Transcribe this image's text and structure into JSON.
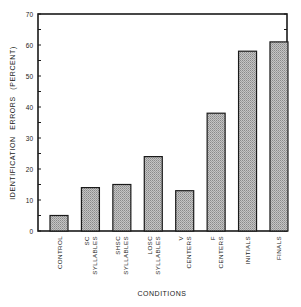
{
  "chart_data": {
    "type": "bar",
    "title": "",
    "xlabel": "CONDITIONS",
    "ylabel": "IDENTIFICATION ERRORS (PERCENT)",
    "ylim": [
      0,
      70
    ],
    "yticks": [
      0,
      10,
      20,
      30,
      40,
      50,
      60,
      70
    ],
    "grid": false,
    "legend": null,
    "categories": [
      [
        "CONTROL"
      ],
      [
        "SC",
        "SYLLABLES"
      ],
      [
        "SHSC",
        "SYLLABLES"
      ],
      [
        "LOSC",
        "SYLLABLES"
      ],
      [
        "V",
        "CENTERS"
      ],
      [
        "F",
        "CENTERS"
      ],
      [
        "INITIALS"
      ],
      [
        "FINALS"
      ]
    ],
    "values": [
      5,
      14,
      15,
      24,
      13,
      38,
      58,
      61
    ],
    "bar_fill": "#b8b8b8",
    "bar_stroke": "#1a1a1a"
  }
}
